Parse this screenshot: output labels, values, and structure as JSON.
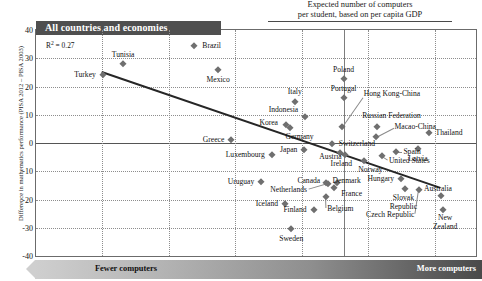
{
  "header_band": {
    "label": "All countries and economies"
  },
  "top_caption": {
    "line1": "Expected number of computers",
    "line2": "per student, based on per capita GDP"
  },
  "annotation": {
    "r2_prefix": "R",
    "r2_sup": "2",
    "r2_value": " = 0.27"
  },
  "axes": {
    "ylabel": "Difference in mathematics performance (PISA 2012 – PISA 2003)",
    "yticks": [
      "40",
      "30",
      "20",
      "10",
      "0",
      "-10",
      "-20",
      "-30",
      "-40"
    ],
    "ylim": [
      -40,
      40
    ],
    "xlim": [
      0,
      100
    ],
    "xlabel_left": "Fewer computers",
    "xlabel_right": "More computers"
  },
  "chart_data": {
    "type": "scatter",
    "title": "All countries and economies",
    "xlabel": "Expected number of computers per student, based on per capita GDP",
    "ylabel": "Difference in mathematics performance (PISA 2012 – PISA 2003)",
    "ylim": [
      -40,
      40
    ],
    "xlim": [
      0,
      100
    ],
    "grid": true,
    "r_squared": 0.27,
    "annotations": [
      "Fewer computers",
      "More computers",
      "Expected number of computers per student, based on per capita GDP"
    ],
    "trendline": {
      "x0": 15.1,
      "y0": 25.5,
      "x1": 92.0,
      "y1": -15.5
    },
    "points": [
      {
        "name": "Tunisia",
        "x": 19.8,
        "y": 28.0
      },
      {
        "name": "Brazil",
        "x": 36.0,
        "y": 34.5
      },
      {
        "name": "Turkey",
        "x": 15.2,
        "y": 24.0
      },
      {
        "name": "Mexico",
        "x": 41.4,
        "y": 26.0
      },
      {
        "name": "Poland",
        "x": 69.9,
        "y": 22.5
      },
      {
        "name": "Portugal",
        "x": 69.9,
        "y": 15.8
      },
      {
        "name": "Italy",
        "x": 58.8,
        "y": 14.5
      },
      {
        "name": "Hong Kong-China",
        "x": 69.5,
        "y": 5.5
      },
      {
        "name": "Indonesia",
        "x": 61.1,
        "y": 9.2
      },
      {
        "name": "Korea",
        "x": 56.8,
        "y": 6.3
      },
      {
        "name": "Russian Federation",
        "x": 77.4,
        "y": 5.8
      },
      {
        "name": "Macao-China",
        "x": 77.2,
        "y": 2.0
      },
      {
        "name": "Thailand",
        "x": 89.3,
        "y": 3.5
      },
      {
        "name": "Germany",
        "x": 57.7,
        "y": 5.2
      },
      {
        "name": "Greece",
        "x": 44.4,
        "y": 1.0
      },
      {
        "name": "Latvia",
        "x": 86.8,
        "y": -2.2
      },
      {
        "name": "Switzerland",
        "x": 67.2,
        "y": -0.5
      },
      {
        "name": "Japan",
        "x": 61.0,
        "y": -2.4
      },
      {
        "name": "Austria",
        "x": 69.2,
        "y": -3.6
      },
      {
        "name": "Spain",
        "x": 81.9,
        "y": -3.1
      },
      {
        "name": "United States",
        "x": 78.6,
        "y": -4.6
      },
      {
        "name": "Luxembourg",
        "x": 53.6,
        "y": -4.2
      },
      {
        "name": "Ireland",
        "x": 70.2,
        "y": -4.4
      },
      {
        "name": "Norway",
        "x": 74.5,
        "y": -6.2
      },
      {
        "name": "Uruguay",
        "x": 51.2,
        "y": -13.8
      },
      {
        "name": "Canada",
        "x": 65.8,
        "y": -14.2
      },
      {
        "name": "Netherlands",
        "x": 66.4,
        "y": -14.6
      },
      {
        "name": "Denmark",
        "x": 68.3,
        "y": -14.2
      },
      {
        "name": "France",
        "x": 67.8,
        "y": -15.9
      },
      {
        "name": "Hungary",
        "x": 83.0,
        "y": -12.9
      },
      {
        "name": "Slovak Republic",
        "x": 83.9,
        "y": -16.4
      },
      {
        "name": "Czech Republic",
        "x": 87.0,
        "y": -16.7
      },
      {
        "name": "Australia",
        "x": 92.0,
        "y": -18.8
      },
      {
        "name": "Belgium",
        "x": 65.9,
        "y": -19.2
      },
      {
        "name": "Iceland",
        "x": 56.6,
        "y": -21.6
      },
      {
        "name": "Finland",
        "x": 63.1,
        "y": -23.6
      },
      {
        "name": "New Zealand",
        "x": 92.6,
        "y": -23.6
      },
      {
        "name": "Sweden",
        "x": 58.0,
        "y": -30.6
      }
    ],
    "labels": [
      {
        "name": "Tunisia",
        "text": "Tunisia",
        "align": "c",
        "x": 19.8,
        "y": 31.2
      },
      {
        "name": "Brazil",
        "text": "Brazil",
        "align": "l",
        "x": 37.8,
        "y": 34.5
      },
      {
        "name": "Turkey",
        "text": "Turkey",
        "align": "r",
        "x": 13.6,
        "y": 24.0
      },
      {
        "name": "Mexico",
        "text": "Mexico",
        "align": "c",
        "x": 41.4,
        "y": 22.2
      },
      {
        "name": "Poland",
        "text": "Poland",
        "align": "c",
        "x": 69.9,
        "y": 26.0
      },
      {
        "name": "Portugal",
        "text": "Portugal",
        "align": "c",
        "x": 69.9,
        "y": 19.2
      },
      {
        "name": "Italy",
        "text": "Italy",
        "align": "c",
        "x": 58.8,
        "y": 18.0
      },
      {
        "name": "Hong Kong-China",
        "text": "Hong Kong-China",
        "align": "l",
        "x": 74.5,
        "y": 17.4
      },
      {
        "name": "Indonesia",
        "text": "Indonesia",
        "align": "r",
        "x": 59.6,
        "y": 11.8
      },
      {
        "name": "Korea",
        "text": "Korea",
        "align": "r",
        "x": 55.0,
        "y": 7.0
      },
      {
        "name": "Russian Federation",
        "text": "Russian Federation",
        "align": "c",
        "x": 80.8,
        "y": 9.4
      },
      {
        "name": "Macao-China",
        "text": "Macao-China",
        "align": "l",
        "x": 81.5,
        "y": 5.8
      },
      {
        "name": "Thailand",
        "text": "Thailand",
        "align": "l",
        "x": 90.8,
        "y": 3.5
      },
      {
        "name": "Germany",
        "text": "Germany",
        "align": "c",
        "x": 59.9,
        "y": 2.0
      },
      {
        "name": "Greece",
        "text": "Greece",
        "align": "r",
        "x": 42.8,
        "y": 1.0
      },
      {
        "name": "Latvia",
        "text": "Latvia",
        "align": "c",
        "x": 86.8,
        "y": -5.6
      },
      {
        "name": "Switzerland",
        "text": "Switzerland",
        "align": "l",
        "x": 68.8,
        "y": -0.5
      },
      {
        "name": "Japan",
        "text": "Japan",
        "align": "r",
        "x": 59.4,
        "y": -2.4
      },
      {
        "name": "Austria",
        "text": "Austria",
        "align": "l",
        "x": 64.4,
        "y": -4.8
      },
      {
        "name": "Spain",
        "text": "Spain",
        "align": "l",
        "x": 83.5,
        "y": -3.1
      },
      {
        "name": "United States",
        "text": "United States",
        "align": "l",
        "x": 80.2,
        "y": -6.4
      },
      {
        "name": "Luxembourg",
        "text": "Luxembourg",
        "align": "r",
        "x": 52.0,
        "y": -4.2
      },
      {
        "name": "Ireland",
        "text": "Ireland",
        "align": "c",
        "x": 69.4,
        "y": -7.4
      },
      {
        "name": "Norway",
        "text": "Norway",
        "align": "c",
        "x": 76.0,
        "y": -9.4
      },
      {
        "name": "Uruguay",
        "text": "Uruguay",
        "align": "r",
        "x": 49.6,
        "y": -13.8
      },
      {
        "name": "Canada",
        "text": "Canada",
        "align": "c",
        "x": 62.0,
        "y": -13.6
      },
      {
        "name": "Denmark",
        "text": "Denmark",
        "align": "c",
        "x": 70.6,
        "y": -13.6
      },
      {
        "name": "Netherlands",
        "text": "Netherlands",
        "align": "r",
        "x": 61.6,
        "y": -16.8
      },
      {
        "name": "France",
        "text": "France",
        "align": "l",
        "x": 69.4,
        "y": -18.0
      },
      {
        "name": "Hungary",
        "text": "Hungary",
        "align": "r",
        "x": 81.4,
        "y": -12.9
      },
      {
        "name": "Slovak Republic",
        "text": "Slovak",
        "align": "c",
        "x": 83.5,
        "y": -19.4
      },
      {
        "name": "Slovak Republic 2",
        "text": "Republic",
        "align": "c",
        "x": 83.5,
        "y": -22.6
      },
      {
        "name": "Czech Republic",
        "text": "Czech Republic",
        "align": "r",
        "x": 86.0,
        "y": -25.4
      },
      {
        "name": "Australia",
        "text": "Australia",
        "align": "l",
        "x": 88.2,
        "y": -16.4
      },
      {
        "name": "Belgium",
        "text": "Belgium",
        "align": "l",
        "x": 66.2,
        "y": -23.4
      },
      {
        "name": "Iceland",
        "text": "Iceland",
        "align": "r",
        "x": 55.0,
        "y": -21.6
      },
      {
        "name": "Finland",
        "text": "Finland",
        "align": "r",
        "x": 61.5,
        "y": -23.6
      },
      {
        "name": "New Zealand",
        "text": "New",
        "align": "c",
        "x": 93.0,
        "y": -26.6
      },
      {
        "name": "New Zealand 2",
        "text": "Zealand",
        "align": "c",
        "x": 93.0,
        "y": -29.8
      },
      {
        "name": "Sweden",
        "text": "Sweden",
        "align": "c",
        "x": 58.0,
        "y": -34.0
      }
    ],
    "leader_lines": [
      {
        "name": "hong-kong-leader",
        "x0": 69.5,
        "y0": 5.5,
        "x1": 74.2,
        "y1": 16.0
      },
      {
        "name": "macao-leader",
        "x0": 77.2,
        "y0": 2.0,
        "x1": 81.2,
        "y1": 5.2
      },
      {
        "name": "czech-leader",
        "x0": 87.0,
        "y0": -16.7,
        "x1": 86.2,
        "y1": -25.0
      },
      {
        "name": "belgium-leader",
        "x0": 65.9,
        "y0": -19.2,
        "x1": 66.0,
        "y1": -23.0
      },
      {
        "name": "netherlands-leader",
        "x0": 66.4,
        "y0": -14.6,
        "x1": 62.0,
        "y1": -16.6
      },
      {
        "name": "united-states-leader",
        "x0": 78.6,
        "y0": -4.6,
        "x1": 80.0,
        "y1": -6.0
      },
      {
        "name": "spain-leader",
        "x0": 81.9,
        "y0": -3.1,
        "x1": 83.2,
        "y1": -3.1
      }
    ]
  }
}
